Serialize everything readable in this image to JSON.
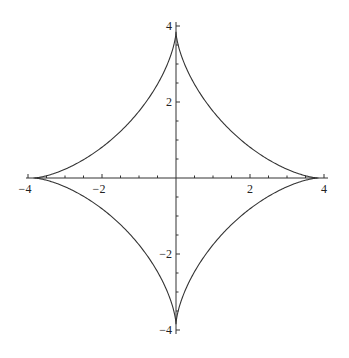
{
  "chart_data": {
    "type": "line",
    "title": "",
    "xlabel": "",
    "ylabel": "",
    "series": [
      {
        "name": "astroid",
        "parametric": "x=a*cos(t)^3, y=a*sin(t)^3",
        "a": 3.85,
        "t_range": [
          0,
          6.2832
        ]
      }
    ],
    "xlim": [
      -4,
      4
    ],
    "ylim": [
      -4,
      4
    ],
    "x_ticks": [
      -4,
      -2,
      2,
      4
    ],
    "y_ticks": [
      -4,
      -2,
      2,
      4
    ],
    "x_tick_labels": [
      "−4",
      "−2",
      "2",
      "4"
    ],
    "y_tick_labels": [
      "−4",
      "−2",
      "2",
      "4"
    ],
    "minor_tick_step": 0.5,
    "grid": false,
    "legend": null
  },
  "axes": {
    "origin_px": [
      176,
      178
    ],
    "px_per_unit_x": 37,
    "px_per_unit_y": 38,
    "line_color": "#333333",
    "curve_color": "#333333"
  }
}
